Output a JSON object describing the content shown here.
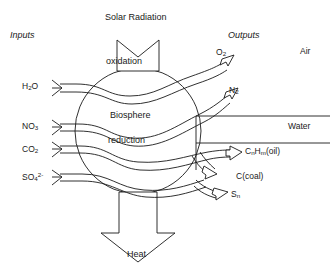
{
  "diagram": {
    "title_top": "Solar Radiation",
    "title_bottom": "Heat",
    "side_headers": {
      "left": "Inputs",
      "right": "Outputs"
    },
    "center_labels": {
      "upper": "oxidation",
      "middle": "Biosphere",
      "lower": "reduction"
    },
    "compartments": [
      {
        "name": "Air"
      },
      {
        "name": "Water"
      }
    ],
    "inputs": [
      {
        "formula": "H2O",
        "base": "H",
        "sub": "2",
        "tail": "O"
      },
      {
        "formula": "NO3",
        "base": "NO",
        "sub": "3",
        "tail": ""
      },
      {
        "formula": "CO2",
        "base": "CO",
        "sub": "2",
        "tail": ""
      },
      {
        "formula": "SO4",
        "base": "SO",
        "sub": "4",
        "sup": "2-",
        "tail": ""
      }
    ],
    "outputs": [
      {
        "base": "O",
        "sub": "2",
        "tail": ""
      },
      {
        "base": "N",
        "sub": "2",
        "tail": ""
      },
      {
        "base": "C",
        "sub": "n",
        "mid": "H",
        "sub2": "m",
        "tail": "(oil)"
      },
      {
        "base": "C",
        "sub": "",
        "tail": "(coal)"
      },
      {
        "base": "S",
        "sub": "n",
        "tail": ""
      }
    ],
    "colors": {
      "stroke": "#1a1a1a",
      "background": "#ffffff"
    }
  }
}
